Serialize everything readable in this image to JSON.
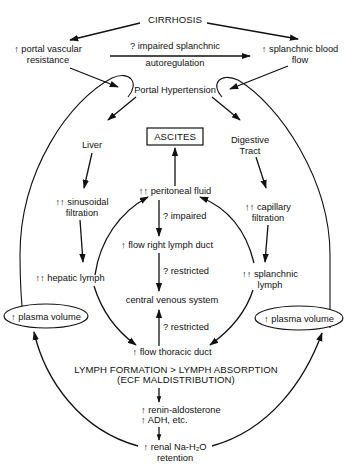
{
  "diagram": {
    "title": "CIRRHOSIS",
    "nodes": {
      "portal_resistance": [
        "↑ portal vascular",
        "resistance"
      ],
      "splanchnic_flow": [
        "↑ splanchnic blood",
        "flow"
      ],
      "autoregulation": [
        "? impaired splanchnic",
        "autoregulation"
      ],
      "portal_hypertension": "Portal Hypertension",
      "liver": "Liver",
      "digestive_tract": [
        "Digestive",
        "Tract"
      ],
      "ascites": "ASCITES",
      "peritoneal_fluid": "↑↑ peritoneal fluid",
      "sinusoidal_filtration": [
        "↑↑ sinusoidal",
        "filtration"
      ],
      "capillary_filtration": [
        "↑↑ capillary",
        "filtration"
      ],
      "impaired": "? impaired",
      "flow_right_lymph_duct": "↑ flow right lymph duct",
      "hepatic_lymph": "↑↑ hepatic lymph",
      "splanchnic_lymph": [
        "↑↑ splanchnic",
        "lymph"
      ],
      "restricted_upper": "? restricted",
      "central_venous_system": "central venous system",
      "restricted_lower": "? restricted",
      "plasma_volume_left": "↑ plasma volume",
      "plasma_volume_right": "↑ plasma volume",
      "flow_thoracic_duct": "↑ flow thoracic duct",
      "lymph_balance": "LYMPH FORMATION > LYMPH ABSORPTION",
      "ecf": "(ECF MALDISTRIBUTION)",
      "renin": [
        "↑ renin-aldosterone",
        "↑ ADH, etc."
      ],
      "renal_retention": [
        "↑ renal Na-H₂O",
        "retention"
      ]
    },
    "colors": {
      "ink": "#111111",
      "background": "#ffffff"
    }
  }
}
